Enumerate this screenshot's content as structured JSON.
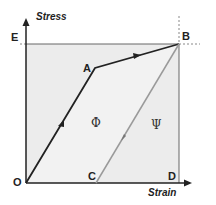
{
  "diagram": {
    "y_axis_label": "Stress",
    "x_axis_label": "Strain",
    "points": {
      "origin": "O",
      "yield": "A",
      "peak": "B",
      "residual": "C",
      "strain_max": "D",
      "stress_max": "E"
    },
    "regions": {
      "dissipated": "Φ",
      "recovered": "Ψ"
    },
    "colors": {
      "loading_path": "#222222",
      "unloading_path": "#9a9a9a",
      "region_fill": "#ededed",
      "guide_lines": "#666666"
    }
  }
}
